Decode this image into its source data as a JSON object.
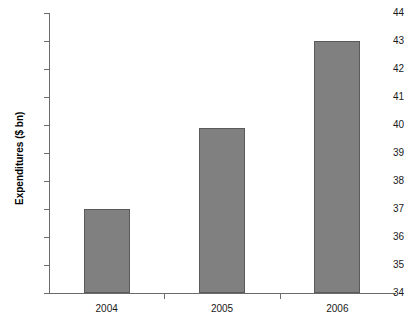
{
  "chart_data": {
    "type": "bar",
    "title": "",
    "subtitle": "",
    "xlabel": "",
    "ylabel": "Expenditures ($ bn)",
    "categories": [
      "2004",
      "2005",
      "2006"
    ],
    "values": [
      37.0,
      39.9,
      43.0
    ],
    "series": [
      {
        "name": "Expenditures",
        "values": [
          37.0,
          39.9,
          43.0
        ]
      }
    ],
    "ylim": [
      34,
      44
    ],
    "ytick_labels": [
      "44",
      "43",
      "42",
      "41",
      "40",
      "39",
      "38",
      "37",
      "36",
      "35",
      "34"
    ],
    "ytick_values": [
      44,
      43,
      42,
      41,
      40,
      39,
      38,
      37,
      36,
      35,
      34
    ],
    "ytick_step": 1,
    "grid": false,
    "legend": false,
    "legend_position": "none",
    "annotations": [],
    "colors": {
      "bar_fill": "#808080",
      "bar_border": "#5a5a5a",
      "axis": "#6b6b6b",
      "text": "#1a1a1a",
      "background": "#ffffff"
    }
  },
  "axes": {
    "y_title": "Expenditures ($ bn)"
  }
}
